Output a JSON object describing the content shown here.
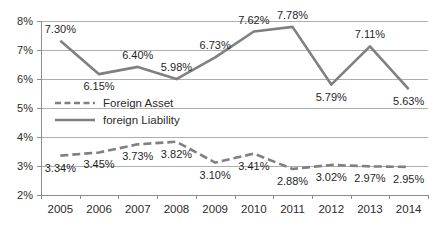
{
  "chart_data": {
    "type": "line",
    "title": "",
    "subtitle": "",
    "xlabel": "",
    "ylabel": "",
    "categories": [
      "2005",
      "2006",
      "2007",
      "2008",
      "2009",
      "2010",
      "2011",
      "2012",
      "2013",
      "2014"
    ],
    "ylim": [
      2,
      8
    ],
    "ytick_values": [
      2,
      3,
      4,
      5,
      6,
      7,
      8
    ],
    "ytick_labels": [
      "2%",
      "3%",
      "4%",
      "5%",
      "6%",
      "7%",
      "8%"
    ],
    "grid": true,
    "legend_position": "inside-left-middle",
    "series": [
      {
        "name": "Foreign Asset",
        "style": "dashed",
        "color": "#808080",
        "values": [
          3.34,
          3.45,
          3.73,
          3.82,
          3.1,
          3.41,
          2.88,
          3.02,
          2.97,
          2.95
        ],
        "labels": [
          "3.34%",
          "3.45%",
          "3.73%",
          "3.82%",
          "3.10%",
          "3.41%",
          "2.88%",
          "3.02%",
          "2.97%",
          "2.95%"
        ],
        "label_positions": [
          "below",
          "below",
          "below",
          "below",
          "below",
          "below",
          "below",
          "below",
          "below",
          "below"
        ]
      },
      {
        "name": "foreign Liability",
        "style": "solid",
        "color": "#808080",
        "values": [
          7.3,
          6.15,
          6.4,
          5.98,
          6.73,
          7.62,
          7.78,
          5.79,
          7.11,
          5.63
        ],
        "labels": [
          "7.30%",
          "6.15%",
          "6.40%",
          "5.98%",
          "6.73%",
          "7.62%",
          "7.78%",
          "5.79%",
          "7.11%",
          "5.63%"
        ],
        "label_positions": [
          "above",
          "below",
          "above",
          "above",
          "above",
          "above",
          "above",
          "below",
          "above",
          "below"
        ]
      }
    ],
    "legend_entries": [
      {
        "label": "Foreign Asset",
        "style": "dashed",
        "color": "#808080"
      },
      {
        "label": "foreign Liability",
        "style": "solid",
        "color": "#808080"
      }
    ],
    "colors": {
      "gridline": "#aeaeae",
      "axis": "#8d8d8d",
      "text": "#2b2b2b",
      "series": "#808080",
      "background": "#ffffff"
    }
  }
}
